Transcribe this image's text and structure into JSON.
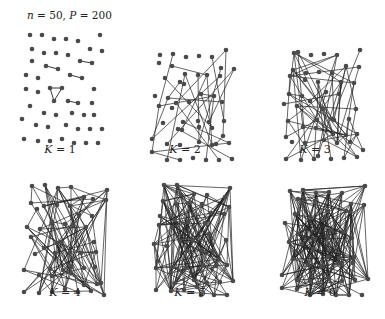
{
  "figure": {
    "title_n_var": "n",
    "title_n_val": " = 50, ",
    "title_p_var": "P",
    "title_p_val": " = 200"
  },
  "panels": [
    {
      "k_var": "K",
      "k_val": " = 1",
      "edges": 6,
      "ox": 20,
      "oy": 33,
      "lx": 30,
      "ly": 152
    },
    {
      "k_var": "K",
      "k_val": " = 2",
      "edges": 30,
      "ox": 150,
      "oy": 50,
      "lx": 165,
      "ly": 152
    },
    {
      "k_var": "K",
      "k_val": " = 3",
      "edges": 70,
      "ox": 280,
      "oy": 50,
      "lx": 295,
      "ly": 152
    },
    {
      "k_var": "K",
      "k_val": " = 4",
      "edges": 120,
      "ox": 23,
      "oy": 185,
      "lx": 35,
      "ly": 289
    },
    {
      "k_var": "K",
      "k_val": " = 5",
      "edges": 175,
      "ox": 151,
      "oy": 185,
      "lx": 163,
      "ly": 289
    },
    {
      "k_var": "K",
      "k_val": " = 6",
      "edges": 230,
      "ox": 282,
      "oy": 185,
      "lx": 294,
      "ly": 289
    }
  ],
  "colors": {
    "node": "#4a4a4a",
    "edge": "#222222",
    "text": "#222222"
  },
  "chart_data": {
    "type": "network",
    "title": "n = 50, P = 200",
    "nodes": 50,
    "panels": [
      "K = 1",
      "K = 2",
      "K = 3",
      "K = 4",
      "K = 5",
      "K = 6"
    ]
  }
}
